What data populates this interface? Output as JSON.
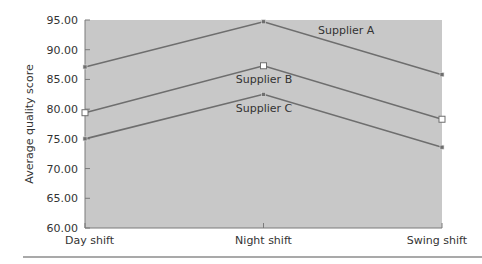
{
  "chart_data": {
    "type": "line",
    "title": "",
    "xlabel": "",
    "ylabel": "Average quality score",
    "categories": [
      "Day shift",
      "Night shift",
      "Swing shift"
    ],
    "ylim": [
      60,
      95
    ],
    "yticks": [
      "60.00",
      "65.00",
      "70.00",
      "75.00",
      "80.00",
      "85.00",
      "90.00",
      "95.00"
    ],
    "grid": false,
    "legend": "inline labels on lines",
    "series": [
      {
        "name": "Supplier A",
        "values": [
          87.1,
          94.7,
          85.8
        ],
        "marker": "filled-square"
      },
      {
        "name": "Supplier B",
        "values": [
          79.4,
          87.3,
          78.3
        ],
        "marker": "hollow-square"
      },
      {
        "name": "Supplier C",
        "values": [
          75.0,
          82.5,
          73.6
        ],
        "marker": "filled-square"
      }
    ]
  },
  "colors": {
    "plot_background": "#c8c8c8",
    "line": "#6e6e6e",
    "axis": "#7a7a7a",
    "rule": "#555555"
  }
}
